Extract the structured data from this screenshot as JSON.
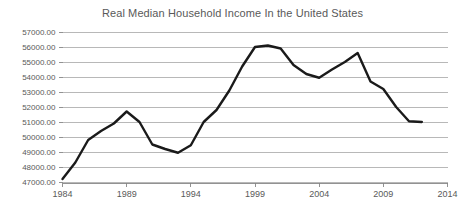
{
  "chart_data": {
    "type": "line",
    "title": "Real Median Household Income In the United States",
    "xlabel": "",
    "ylabel": "",
    "grid": true,
    "legend": "none",
    "xlim": [
      1984,
      2014
    ],
    "ylim": [
      47000,
      57000
    ],
    "ytick_labels": [
      "57000.00",
      "56000.00",
      "55000.00",
      "54000.00",
      "53000.00",
      "52000.00",
      "51000.00",
      "50000.00",
      "49000.00",
      "48000.00",
      "47000.00"
    ],
    "ytick_values": [
      57000,
      56000,
      55000,
      54000,
      53000,
      52000,
      51000,
      50000,
      49000,
      48000,
      47000
    ],
    "xtick_labels": [
      "1984",
      "1989",
      "1994",
      "1999",
      "2004",
      "2009",
      "2014"
    ],
    "xtick_values": [
      1984,
      1989,
      1994,
      1999,
      2004,
      2009,
      2014
    ],
    "series": [
      {
        "name": "Real Median Household Income",
        "color": "#1a1a1a",
        "x": [
          1984,
          1985,
          1986,
          1987,
          1988,
          1989,
          1990,
          1991,
          1992,
          1993,
          1994,
          1995,
          1996,
          1997,
          1998,
          1999,
          2000,
          2001,
          2002,
          2003,
          2004,
          2005,
          2006,
          2007,
          2008,
          2009,
          2010,
          2011,
          2012
        ],
        "values": [
          47200,
          48300,
          49800,
          50400,
          50900,
          51700,
          51000,
          49500,
          49200,
          48950,
          49450,
          51000,
          51800,
          53100,
          54700,
          56000,
          56100,
          55900,
          54800,
          54200,
          53950,
          54500,
          55000,
          55600,
          53700,
          53200,
          52000,
          51050,
          51000
        ]
      }
    ]
  }
}
